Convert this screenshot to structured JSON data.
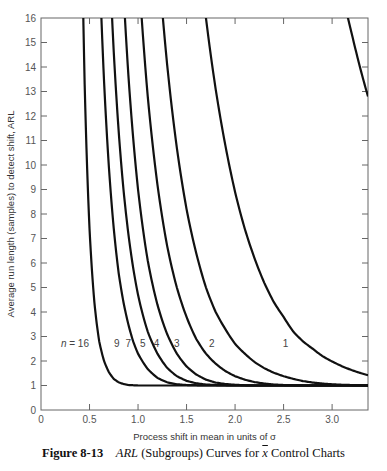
{
  "chart_data": {
    "type": "line",
    "title": "",
    "xlabel": "Process shift in mean in units of σ",
    "ylabel": "Average run length (samples) to detect shift, ARL",
    "xlim": [
      0,
      3.37
    ],
    "ylim": [
      0,
      16
    ],
    "grid": false,
    "legend": "inline curve labels",
    "x_ticks": [
      0,
      0.5,
      1.0,
      1.5,
      2.0,
      2.5,
      3.0
    ],
    "x_tick_labels": [
      "0",
      "0.5",
      "1.0",
      "1.5",
      "2.0",
      "2.5",
      "3.0"
    ],
    "y_ticks": [
      0,
      1,
      2,
      3,
      4,
      5,
      6,
      7,
      8,
      9,
      10,
      11,
      12,
      13,
      14,
      15,
      16
    ],
    "y_tick_labels": [
      "0",
      "1",
      "2",
      "3",
      "4",
      "5",
      "6",
      "7",
      "8",
      "9",
      "10",
      "11",
      "12",
      "13",
      "14",
      "15",
      "16"
    ],
    "x": [
      0.3,
      0.35,
      0.4,
      0.45,
      0.5,
      0.55,
      0.6,
      0.65,
      0.7,
      0.75,
      0.8,
      0.85,
      0.9,
      0.95,
      1.0,
      1.1,
      1.2,
      1.3,
      1.4,
      1.5,
      1.6,
      1.7,
      1.8,
      1.9,
      2.0,
      2.1,
      2.2,
      2.3,
      2.4,
      2.5,
      2.6,
      2.7,
      2.8,
      2.9,
      3.0,
      3.1,
      3.2,
      3.3,
      3.37
    ],
    "series": [
      {
        "name": "n = 16",
        "label": "n = 16",
        "label_pos": [
          0.35,
          2.7
        ],
        "values": [
          118.7,
          53.6,
          25.8,
          13.3,
          7.4,
          4.4,
          2.8,
          2.0,
          1.54,
          1.27,
          1.13,
          1.06,
          1.02,
          1.01,
          1.0,
          1.0,
          1.0,
          1.0,
          1.0,
          1.0,
          1.0,
          1.0,
          1.0,
          1.0,
          1.0,
          1.0,
          1.0,
          1.0,
          1.0,
          1.0,
          1.0,
          1.0,
          1.0,
          1.0,
          1.0,
          1.0,
          1.0,
          1.0,
          1.0
        ]
      },
      {
        "name": "n = 9",
        "label": "9",
        "label_pos": [
          0.78,
          2.7
        ],
        "values": [
          204.4,
          129.3,
          83.8,
          55.6,
          37.8,
          26.2,
          18.5,
          13.4,
          9.9,
          7.4,
          5.6,
          4.4,
          3.5,
          2.8,
          2.3,
          1.67,
          1.31,
          1.13,
          1.05,
          1.02,
          1.01,
          1.0,
          1.0,
          1.0,
          1.0,
          1.0,
          1.0,
          1.0,
          1.0,
          1.0,
          1.0,
          1.0,
          1.0,
          1.0,
          1.0,
          1.0,
          1.0,
          1.0,
          1.0
        ]
      },
      {
        "name": "n = 7",
        "label": "7",
        "label_pos": [
          0.9,
          2.7
        ],
        "values": [
          237.2,
          166.9,
          118.7,
          85.0,
          61.6,
          45.1,
          33.4,
          25.1,
          19.0,
          14.6,
          11.4,
          9.0,
          7.2,
          5.8,
          4.7,
          3.2,
          2.3,
          1.72,
          1.38,
          1.19,
          1.09,
          1.04,
          1.02,
          1.01,
          1.0,
          1.0,
          1.0,
          1.0,
          1.0,
          1.0,
          1.0,
          1.0,
          1.0,
          1.0,
          1.0,
          1.0,
          1.0,
          1.0,
          1.0
        ]
      },
      {
        "name": "n = 5",
        "label": "5",
        "label_pos": [
          1.05,
          2.7
        ],
        "values": [
          267.4,
          208.3,
          161.7,
          125.0,
          96.3,
          74.3,
          57.4,
          44.5,
          34.7,
          27.2,
          21.5,
          17.1,
          13.7,
          11.1,
          9.0,
          6.1,
          4.3,
          3.1,
          2.3,
          1.78,
          1.45,
          1.24,
          1.12,
          1.06,
          1.03,
          1.01,
          1.0,
          1.0,
          1.0,
          1.0,
          1.0,
          1.0,
          1.0,
          1.0,
          1.0,
          1.0,
          1.0,
          1.0,
          1.0
        ]
      },
      {
        "name": "n = 4",
        "label": "4",
        "label_pos": [
          1.19,
          2.7
        ],
        "values": [
          289.0,
          238.4,
          195.7,
          160.1,
          130.8,
          106.7,
          87.1,
          71.1,
          58.1,
          47.6,
          39.1,
          32.2,
          26.6,
          22.0,
          18.3,
          12.8,
          9.2,
          6.7,
          5.0,
          3.8,
          2.9,
          2.3,
          1.89,
          1.59,
          1.38,
          1.24,
          1.14,
          1.08,
          1.04,
          1.02,
          1.01,
          1.0,
          1.0,
          1.0,
          1.0,
          1.0,
          1.0,
          1.0,
          1.0
        ]
      },
      {
        "name": "n = 3",
        "label": "3",
        "label_pos": [
          1.4,
          2.7
        ],
        "values": [
          306.8,
          266.6,
          230.5,
          198.3,
          170.2,
          145.8,
          124.6,
          106.3,
          90.5,
          77.1,
          65.6,
          55.8,
          47.6,
          40.6,
          34.6,
          25.4,
          18.8,
          14.1,
          10.7,
          8.2,
          6.4,
          5.0,
          4.0,
          3.3,
          2.7,
          2.3,
          1.96,
          1.71,
          1.52,
          1.38,
          1.27,
          1.18,
          1.12,
          1.08,
          1.05,
          1.03,
          1.02,
          1.01,
          1.0
        ]
      },
      {
        "name": "n = 2",
        "label": "2",
        "label_pos": [
          1.76,
          2.7
        ],
        "values": [
          332.8,
          305.2,
          278.8,
          253.8,
          230.2,
          208.1,
          187.6,
          168.6,
          151.2,
          135.3,
          120.9,
          107.8,
          96.0,
          85.5,
          76.0,
          60.1,
          47.7,
          38.0,
          30.4,
          24.4,
          19.7,
          16.0,
          13.1,
          10.8,
          8.9,
          7.4,
          6.2,
          5.2,
          4.4,
          3.8,
          3.2,
          2.8,
          2.5,
          2.2,
          1.98,
          1.79,
          1.63,
          1.5,
          1.42
        ]
      },
      {
        "name": "n = 1",
        "label": "1",
        "label_pos": [
          2.52,
          2.7
        ],
        "values": [
          352.5,
          340.4,
          327.5,
          314.2,
          300.7,
          287.3,
          274.0,
          261.0,
          248.4,
          236.1,
          224.2,
          212.8,
          201.8,
          191.3,
          181.3,
          162.8,
          145.9,
          130.5,
          116.6,
          104.2,
          93.0,
          83.0,
          74.1,
          66.1,
          59.0,
          52.6,
          46.9,
          41.9,
          37.4,
          33.4,
          29.8,
          26.6,
          23.8,
          21.3,
          19.1,
          17.1,
          15.4,
          13.8,
          12.8
        ]
      }
    ]
  },
  "curve_data_1_detail": {
    "x": [
      1.4,
      1.5,
      1.6,
      1.7,
      1.8,
      1.9,
      2.0,
      2.1,
      2.2,
      2.3,
      2.4,
      2.5,
      2.6,
      2.7,
      2.8,
      2.9,
      3.0,
      3.1,
      3.2,
      3.3,
      3.37
    ],
    "values": [
      116.6,
      104.2,
      93.0,
      83.0,
      74.1,
      66.1,
      59.0,
      52.6,
      46.9,
      41.9,
      37.4,
      33.4,
      29.8,
      26.6,
      23.8,
      21.3,
      19.1,
      17.1,
      15.4,
      13.8,
      12.8
    ]
  },
  "caption": {
    "figure_number": "Figure 8-13",
    "arl_text": "ARL",
    "middle_text": " (Subgroups) Curves for ",
    "xbar_text": "x",
    "end_text": " Control Charts"
  }
}
